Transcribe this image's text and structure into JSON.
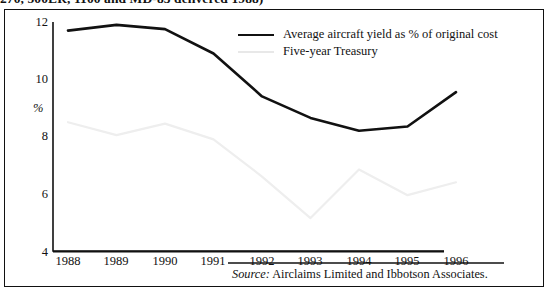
{
  "caption": {
    "text": "270, 500ER, 1100 and MD-83 delivered 1988)"
  },
  "chart_data": {
    "type": "line",
    "title": "",
    "subtitle": "",
    "xlabel": "",
    "ylabel": "%",
    "categories": [
      "1988",
      "1989",
      "1990",
      "1991",
      "1992",
      "1993",
      "1994",
      "1995",
      "1996"
    ],
    "x": [
      1988,
      1989,
      1990,
      1991,
      1992,
      1993,
      1994,
      1995,
      1996
    ],
    "xlim": [
      1988,
      1996
    ],
    "ylim": [
      4,
      12
    ],
    "yticks": [
      4,
      6,
      8,
      10,
      12
    ],
    "ytick_labels": [
      "4",
      "6",
      "8",
      "10",
      "12"
    ],
    "grid": false,
    "legend_position": "upper-right-inside",
    "series": [
      {
        "name": "Average aircraft yield as % of original cost",
        "color": "#111111",
        "values": [
          11.7,
          11.9,
          11.75,
          10.9,
          9.4,
          8.65,
          8.2,
          8.35,
          9.55
        ]
      },
      {
        "name": "Five-year Treasury",
        "color": "#eeeeee",
        "values": [
          8.5,
          8.05,
          8.45,
          7.9,
          6.6,
          5.15,
          6.85,
          5.95,
          6.4
        ]
      }
    ],
    "source": {
      "keyword": "Source:",
      "text": "Airclaims Limited and Ibbotson Associates."
    }
  },
  "legend": {
    "items": [
      {
        "label": "Average aircraft yield as % of original cost",
        "color": "#111111"
      },
      {
        "label": "Five-year Treasury",
        "color": "#eeeeee"
      }
    ]
  },
  "axis": {
    "y_label": "%",
    "y_ticks": [
      "12",
      "10",
      "8",
      "6",
      "4"
    ],
    "x_ticks": [
      "1988",
      "1989",
      "1990",
      "1991",
      "1992",
      "1993",
      "1994",
      "1995",
      "1996"
    ]
  }
}
